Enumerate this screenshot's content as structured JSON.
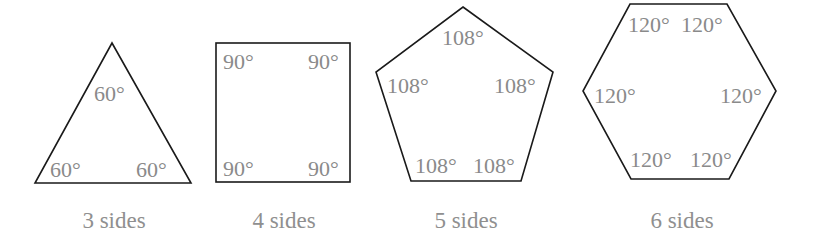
{
  "shapes": [
    {
      "name": "triangle",
      "caption": "3 sides",
      "angles": [
        "60°",
        "60°",
        "60°"
      ]
    },
    {
      "name": "square",
      "caption": "4 sides",
      "angles": [
        "90°",
        "90°",
        "90°",
        "90°"
      ]
    },
    {
      "name": "pentagon",
      "caption": "5 sides",
      "angles": [
        "108°",
        "108°",
        "108°",
        "108°",
        "108°"
      ]
    },
    {
      "name": "hexagon",
      "caption": "6 sides",
      "angles": [
        "120°",
        "120°",
        "120°",
        "120°",
        "120°",
        "120°"
      ]
    }
  ],
  "colors": {
    "outline": "#1a1a1a",
    "label": "#8a8a8a"
  }
}
